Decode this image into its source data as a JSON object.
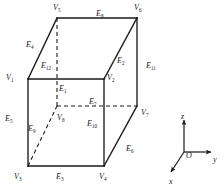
{
  "figure": {
    "type": "cube-labeling-diagram",
    "background_color": "#ffffff",
    "line_color": "#1a1a1a",
    "solid_line_width": 1.3,
    "dashed_line_width": 1.1,
    "dash_pattern": "4,3"
  },
  "vertices": [
    {
      "id": "V1",
      "label": "V",
      "sub": "1",
      "x": 6,
      "y": 74,
      "px": 28,
      "py": 79,
      "hidden": false
    },
    {
      "id": "V2",
      "label": "V",
      "sub": "2",
      "x": 107,
      "y": 74,
      "px": 104,
      "py": 79,
      "hidden": false
    },
    {
      "id": "V3",
      "label": "V",
      "sub": "3",
      "x": 14,
      "y": 173,
      "px": 28,
      "py": 166,
      "hidden": false
    },
    {
      "id": "V4",
      "label": "V",
      "sub": "4",
      "x": 99,
      "y": 173,
      "px": 104,
      "py": 166,
      "hidden": false
    },
    {
      "id": "V5",
      "label": "V",
      "sub": "5",
      "x": 53,
      "y": 4,
      "px": 57,
      "py": 18,
      "hidden": false
    },
    {
      "id": "V6",
      "label": "V",
      "sub": "6",
      "x": 134,
      "y": 4,
      "px": 137,
      "py": 18,
      "hidden": false
    },
    {
      "id": "V7",
      "label": "V",
      "sub": "7",
      "x": 141,
      "y": 109,
      "px": 137,
      "py": 106,
      "hidden": false
    },
    {
      "id": "V8",
      "label": "V",
      "sub": "8",
      "x": 57,
      "y": 114,
      "px": 57,
      "py": 106,
      "hidden": true
    }
  ],
  "edges": [
    {
      "id": "E1",
      "label": "E",
      "sub": "1",
      "x": 59,
      "y": 85,
      "hidden": true,
      "from": "V5",
      "to": "V8"
    },
    {
      "id": "E2",
      "label": "E",
      "sub": "2",
      "x": 117,
      "y": 57,
      "hidden": false,
      "from": "V2",
      "to": "V6"
    },
    {
      "id": "E3",
      "label": "E",
      "sub": "3",
      "x": 56,
      "y": 173,
      "hidden": false,
      "from": "V3",
      "to": "V4"
    },
    {
      "id": "E4",
      "label": "E",
      "sub": "4",
      "x": 26,
      "y": 41,
      "hidden": false,
      "from": "V1",
      "to": "V5"
    },
    {
      "id": "E5",
      "label": "E",
      "sub": "5",
      "x": 5,
      "y": 115,
      "hidden": false,
      "from": "V1",
      "to": "V3"
    },
    {
      "id": "E6",
      "label": "E",
      "sub": "6",
      "x": 126,
      "y": 145,
      "hidden": false,
      "from": "V4",
      "to": "V7"
    },
    {
      "id": "E7",
      "label": "E",
      "sub": "7",
      "x": 89,
      "y": 98,
      "hidden": true,
      "from": "V8",
      "to": "V7"
    },
    {
      "id": "E8",
      "label": "E",
      "sub": "8",
      "x": 96,
      "y": 10,
      "hidden": false,
      "from": "V5",
      "to": "V6"
    },
    {
      "id": "E9",
      "label": "E",
      "sub": "9",
      "x": 28,
      "y": 125,
      "hidden": true,
      "from": "V3",
      "to": "V8"
    },
    {
      "id": "E10",
      "label": "E",
      "sub": "10",
      "x": 87,
      "y": 120,
      "hidden": true,
      "from": "V4",
      "to": "V8"
    },
    {
      "id": "E11",
      "label": "E",
      "sub": "11",
      "x": 146,
      "y": 62,
      "hidden": false,
      "from": "V6",
      "to": "V7"
    },
    {
      "id": "E12",
      "label": "E",
      "sub": "12",
      "x": 41,
      "y": 62,
      "hidden": true,
      "from": "V1",
      "to": "V8"
    }
  ],
  "axes": {
    "origin": {
      "label": "O",
      "x": 186,
      "y": 151
    },
    "origin_point": {
      "px": 184,
      "py": 152
    },
    "items": [
      {
        "id": "z",
        "label": "z",
        "x": 181,
        "y": 112,
        "direction": "up",
        "tip_x": 184,
        "tip_y": 122
      },
      {
        "id": "y",
        "label": "y",
        "x": 213,
        "y": 155,
        "direction": "right",
        "tip_x": 207,
        "tip_y": 152
      },
      {
        "id": "x",
        "label": "x",
        "x": 169,
        "y": 177,
        "direction": "lower-left",
        "tip_x": 170,
        "tip_y": 170
      }
    ]
  }
}
